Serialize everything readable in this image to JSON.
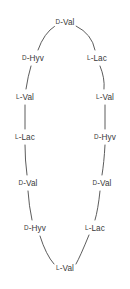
{
  "figure": {
    "type": "cyclic-depsipeptide-ring",
    "background_color": "#ffffff",
    "bond_color": "#4a4a4a",
    "text_color": "#3a3a3a",
    "canvas": {
      "width": 130,
      "height": 289
    }
  },
  "ring": {
    "residue_count": 12,
    "residues": [
      {
        "id": "r1",
        "stereo": "D",
        "sep": "-",
        "name": "Val",
        "full": "D-Val",
        "position": "top",
        "x": 65,
        "y": 22
      },
      {
        "id": "r2",
        "stereo": "L",
        "sep": "-",
        "name": "Lac",
        "full": "L-Lac",
        "position": "right-1",
        "x": 97,
        "y": 58
      },
      {
        "id": "r3",
        "stereo": "L",
        "sep": "-",
        "name": "Val",
        "full": "L-Val",
        "position": "right-2",
        "x": 105,
        "y": 97
      },
      {
        "id": "r4",
        "stereo": "D",
        "sep": "-",
        "name": "Hyv",
        "full": "D-Hyv",
        "position": "right-3",
        "x": 105,
        "y": 137
      },
      {
        "id": "r5",
        "stereo": "D",
        "sep": "-",
        "name": "Val",
        "full": "D-Val",
        "position": "right-4",
        "x": 102,
        "y": 183
      },
      {
        "id": "r6",
        "stereo": "L",
        "sep": "-",
        "name": "Lac",
        "full": "L-Lac",
        "position": "right-5",
        "x": 95,
        "y": 228
      },
      {
        "id": "r7",
        "stereo": "L",
        "sep": "-",
        "name": "Val",
        "full": "L-Val",
        "position": "bottom",
        "x": 65,
        "y": 268
      },
      {
        "id": "r8",
        "stereo": "D",
        "sep": "-",
        "name": "Hyv",
        "full": "D-Hyv",
        "position": "left-5",
        "x": 35,
        "y": 228
      },
      {
        "id": "r9",
        "stereo": "D",
        "sep": "-",
        "name": "Val",
        "full": "D-Val",
        "position": "left-4",
        "x": 28,
        "y": 183
      },
      {
        "id": "r10",
        "stereo": "L",
        "sep": "-",
        "name": "Lac",
        "full": "L-Lac",
        "position": "left-3",
        "x": 25,
        "y": 137
      },
      {
        "id": "r11",
        "stereo": "L",
        "sep": "-",
        "name": "Val",
        "full": "L-Val",
        "position": "left-2",
        "x": 25,
        "y": 97
      },
      {
        "id": "r12",
        "stereo": "D",
        "sep": "-",
        "name": "Hyv",
        "full": "D-Hyv",
        "position": "left-1",
        "x": 33,
        "y": 58
      }
    ],
    "bonds": [
      {
        "from": "r1",
        "to": "r2",
        "path": "M 76 26 Q 92 34 95 50"
      },
      {
        "from": "r2",
        "to": "r3",
        "path": "M 100 66 Q 105 78 104 89"
      },
      {
        "from": "r3",
        "to": "r4",
        "path": "M 105 105 L 105 129"
      },
      {
        "from": "r4",
        "to": "r5",
        "path": "M 105 145 Q 104 163 102 175"
      },
      {
        "from": "r5",
        "to": "r6",
        "path": "M 100 191 Q 98 210 95 220"
      },
      {
        "from": "r6",
        "to": "r7",
        "path": "M 89 235 Q 80 257 76 264"
      },
      {
        "from": "r7",
        "to": "r8",
        "path": "M 54 264 Q 46 255 40 236"
      },
      {
        "from": "r8",
        "to": "r9",
        "path": "M 32 220 Q 29 206 28 191"
      },
      {
        "from": "r9",
        "to": "r10",
        "path": "M 27 175 Q 25 160 25 145"
      },
      {
        "from": "r10",
        "to": "r11",
        "path": "M 25 129 L 25 105"
      },
      {
        "from": "r11",
        "to": "r12",
        "path": "M 26 89 Q 28 76 31 66"
      },
      {
        "from": "r12",
        "to": "r1",
        "path": "M 38 50 Q 44 33 55 26"
      }
    ]
  }
}
